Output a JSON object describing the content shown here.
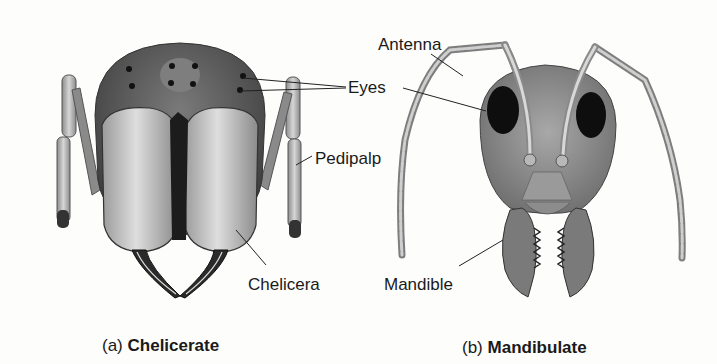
{
  "figure": {
    "panels": [
      {
        "id": "a",
        "caption_prefix": "(a)",
        "caption_title": "Chelicerate",
        "labels": [
          "Eyes",
          "Pedipalp",
          "Chelicera"
        ]
      },
      {
        "id": "b",
        "caption_prefix": "(b)",
        "caption_title": "Mandibulate",
        "labels": [
          "Antenna",
          "Eyes",
          "Mandible"
        ]
      }
    ],
    "shared_labels": {
      "eyes": "Eyes"
    },
    "labels": {
      "antenna": "Antenna",
      "eyes": "Eyes",
      "pedipalp": "Pedipalp",
      "chelicera": "Chelicera",
      "mandible": "Mandible"
    },
    "colors": {
      "background": "#fdfdfc",
      "head_dark": "#4a4a4a",
      "appendage_light": "#c8c8c8",
      "line": "#222222"
    }
  }
}
